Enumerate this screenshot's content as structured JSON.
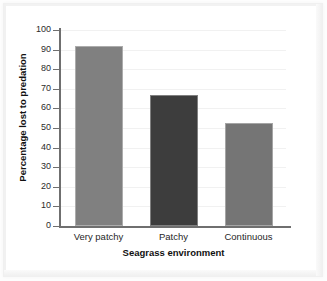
{
  "chart_data": {
    "type": "bar",
    "title": "",
    "xlabel": "Seagrass environment",
    "ylabel": "Percentage lost to predation",
    "categories": [
      "Very patchy",
      "Patchy",
      "Continuous"
    ],
    "values": [
      92,
      67,
      52.5
    ],
    "series": [
      {
        "name": "Percentage lost to predation",
        "values": [
          92,
          67,
          52.5
        ]
      }
    ],
    "ylim": [
      0,
      100
    ],
    "yticks": [
      0,
      10,
      20,
      30,
      40,
      50,
      60,
      70,
      80,
      90,
      100
    ],
    "ytick_labels": [
      "0",
      "10",
      "20",
      "30",
      "40",
      "50",
      "60",
      "70",
      "80",
      "90",
      "100"
    ],
    "grid": true,
    "grid_axis": "y",
    "legend": false,
    "legend_position": "none",
    "bar_colors": [
      "#808080",
      "#3d3d3d",
      "#757575"
    ],
    "annotations": []
  },
  "axes": {
    "y_title": "Percentage lost to predation",
    "x_title": "Seagrass environment"
  },
  "colors": {
    "bar_light": "#808080",
    "bar_dark": "#3d3d3d",
    "bar_mid": "#757575",
    "axis": "#6f6f6f",
    "grid": "#f1f1f1",
    "text": "#1f1f1f",
    "page_bg": "#fdfdfd",
    "plot_bg": "#ffffff"
  }
}
